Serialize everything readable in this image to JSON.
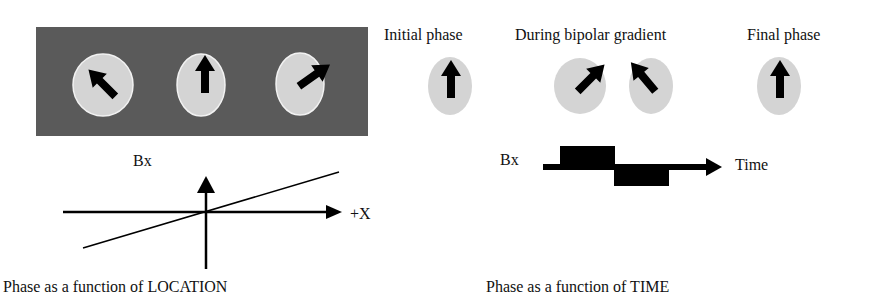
{
  "left_panel": {
    "image": {
      "background_color": "#5a5a5a",
      "spins": [
        {
          "label": "left-spin",
          "angle_deg": -45
        },
        {
          "label": "center-spin",
          "angle_deg": 0
        },
        {
          "label": "right-spin",
          "angle_deg": 55
        }
      ]
    },
    "graph": {
      "y_label": "Bx",
      "x_label": "+X",
      "caption": "Phase as a function of LOCATION"
    }
  },
  "right_panel": {
    "phases": {
      "initial_label": "Initial phase",
      "during_label": "During bipolar gradient",
      "final_label": "Final phase",
      "spins": [
        {
          "label": "initial",
          "angle_deg": 0
        },
        {
          "label": "during-1",
          "angle_deg": 45
        },
        {
          "label": "during-2",
          "angle_deg": -40
        },
        {
          "label": "final",
          "angle_deg": 0
        }
      ]
    },
    "graph": {
      "y_label": "Bx",
      "x_label": "Time",
      "caption": "Phase as a function of TIME"
    }
  },
  "colors": {
    "spin_fill": "#d4d4d4",
    "arrow": "#000000",
    "dark_bg": "#5a5a5a"
  }
}
